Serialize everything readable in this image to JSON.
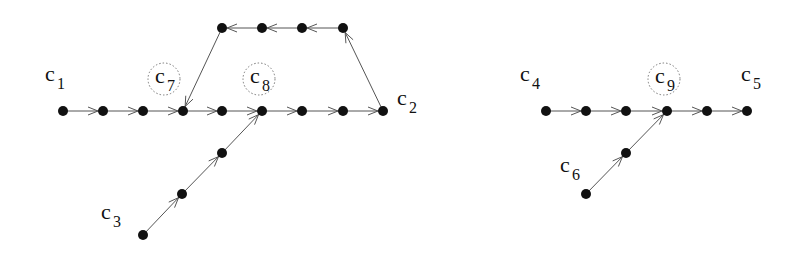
{
  "diagram": {
    "type": "directed-graph",
    "graphs": [
      {
        "id": "left",
        "nodes": [
          "n1",
          "n2",
          "n3",
          "n4",
          "n5",
          "n6",
          "n7",
          "n8",
          "n9",
          "t1",
          "t2",
          "t3",
          "t4",
          "b1",
          "b2",
          "b3"
        ],
        "edges": [
          [
            "n1",
            "n2"
          ],
          [
            "n2",
            "n3"
          ],
          [
            "n3",
            "n4"
          ],
          [
            "n4",
            "n5"
          ],
          [
            "n5",
            "n6"
          ],
          [
            "n6",
            "n7"
          ],
          [
            "n7",
            "n8"
          ],
          [
            "n8",
            "n9"
          ],
          [
            "n9",
            "t4"
          ],
          [
            "t4",
            "t3"
          ],
          [
            "t3",
            "t2"
          ],
          [
            "t2",
            "t1"
          ],
          [
            "t1",
            "n4"
          ],
          [
            "b1",
            "b2"
          ],
          [
            "b2",
            "b3"
          ],
          [
            "b3",
            "n6"
          ]
        ],
        "labels": [
          {
            "text": "c",
            "sub": "1",
            "node": "n1",
            "circled": false
          },
          {
            "text": "c",
            "sub": "7",
            "node": "n4",
            "circled": true
          },
          {
            "text": "c",
            "sub": "8",
            "node": "n6",
            "circled": true
          },
          {
            "text": "c",
            "sub": "2",
            "node": "n9",
            "circled": false
          },
          {
            "text": "c",
            "sub": "3",
            "node": "b1",
            "circled": false
          }
        ]
      },
      {
        "id": "right",
        "nodes": [
          "m1",
          "m2",
          "m3",
          "m4",
          "m5",
          "m6",
          "k1",
          "k2"
        ],
        "edges": [
          [
            "m1",
            "m2"
          ],
          [
            "m2",
            "m3"
          ],
          [
            "m3",
            "m4"
          ],
          [
            "m4",
            "m5"
          ],
          [
            "m5",
            "m6"
          ],
          [
            "k1",
            "k2"
          ],
          [
            "k2",
            "m4"
          ]
        ],
        "labels": [
          {
            "text": "c",
            "sub": "4",
            "node": "m1",
            "circled": false
          },
          {
            "text": "c",
            "sub": "9",
            "node": "m4",
            "circled": true
          },
          {
            "text": "c",
            "sub": "5",
            "node": "m6",
            "circled": false
          },
          {
            "text": "c",
            "sub": "6",
            "node": "k1",
            "circled": false
          }
        ]
      }
    ]
  }
}
